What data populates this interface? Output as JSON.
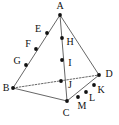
{
  "figure": {
    "type": "geometry-diagram",
    "shape_name": "tetrahedron",
    "width": 119,
    "height": 125,
    "background_color": "#ffffff",
    "stroke_color": "#555555",
    "point_color": "#111111",
    "label_color": "#111111",
    "hidden_edge_style": "dashed"
  },
  "points": [
    {
      "id": "A",
      "label": "A",
      "x": 60,
      "y": 15,
      "label_x": 60,
      "label_y": 6,
      "role": "apex-vertex"
    },
    {
      "id": "B",
      "label": "B",
      "x": 13,
      "y": 88,
      "label_x": 6,
      "label_y": 88,
      "role": "base-vertex"
    },
    {
      "id": "C",
      "label": "C",
      "x": 67,
      "y": 101,
      "label_x": 66,
      "label_y": 113,
      "role": "base-vertex"
    },
    {
      "id": "D",
      "label": "D",
      "x": 99,
      "y": 75,
      "label_x": 109,
      "label_y": 74,
      "role": "base-vertex"
    },
    {
      "id": "E",
      "label": "E",
      "x": 47,
      "y": 33,
      "label_x": 38,
      "label_y": 29,
      "role": "division-point"
    },
    {
      "id": "F",
      "label": "F",
      "x": 36,
      "y": 49,
      "label_x": 28,
      "label_y": 44,
      "role": "division-point"
    },
    {
      "id": "G",
      "label": "G",
      "x": 26,
      "y": 65,
      "label_x": 17,
      "label_y": 61,
      "role": "division-point"
    },
    {
      "id": "H",
      "label": "H",
      "x": 62,
      "y": 38,
      "label_x": 70,
      "label_y": 42,
      "role": "division-point"
    },
    {
      "id": "I",
      "label": "I",
      "x": 62,
      "y": 60,
      "label_x": 70,
      "label_y": 63,
      "role": "division-point"
    },
    {
      "id": "J",
      "label": "J",
      "x": 61,
      "y": 81,
      "label_x": 70,
      "label_y": 85,
      "role": "division-point"
    },
    {
      "id": "K",
      "label": "K",
      "x": 94,
      "y": 85,
      "label_x": 101,
      "label_y": 90,
      "role": "division-point"
    },
    {
      "id": "L",
      "label": "L",
      "x": 86,
      "y": 92,
      "label_x": 92,
      "label_y": 98,
      "role": "division-point"
    },
    {
      "id": "M",
      "label": "M",
      "x": 78,
      "y": 97,
      "label_x": 82,
      "label_y": 106,
      "role": "division-point"
    }
  ],
  "edges": [
    {
      "id": "A-B",
      "from": "A",
      "to": "B",
      "style": "solid",
      "name": "edge-ab"
    },
    {
      "id": "A-C",
      "from": "A",
      "to": "C",
      "style": "solid",
      "name": "edge-ac"
    },
    {
      "id": "A-D",
      "from": "A",
      "to": "D",
      "style": "solid",
      "name": "edge-ad"
    },
    {
      "id": "B-C",
      "from": "B",
      "to": "C",
      "style": "solid",
      "name": "edge-bc"
    },
    {
      "id": "C-D",
      "from": "C",
      "to": "D",
      "style": "solid",
      "name": "edge-cd"
    },
    {
      "id": "B-D",
      "from": "B",
      "to": "D",
      "style": "dashed",
      "name": "edge-bd-hidden"
    }
  ],
  "point_radius": 1.9,
  "stroke_width": 0.9
}
